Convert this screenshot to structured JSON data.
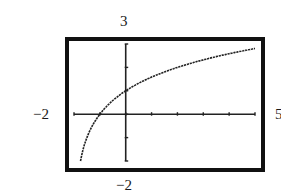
{
  "chart_data": {
    "type": "line",
    "title": "",
    "xlabel": "",
    "ylabel": "",
    "xlim": [
      -2,
      5
    ],
    "ylim": [
      -2,
      3
    ],
    "xscale": 1,
    "yscale": 1,
    "grid": false,
    "legend": null,
    "window_labels": {
      "xmin": "−2",
      "xmax": "5",
      "ymin": "−2",
      "ymax": "3"
    },
    "series": [
      {
        "name": "curve",
        "description": "logarithmic curve through (-1, 0) and (0, 1), vertical asymptote near x = -2",
        "x": [
          -1.8,
          -1.5,
          -1,
          -0.5,
          0,
          0.5,
          1,
          1.5,
          2,
          2.5,
          3,
          3.5,
          4,
          4.5,
          5
        ],
        "values": [
          -2.0,
          -1.0,
          0.0,
          0.58,
          1.0,
          1.32,
          1.58,
          1.81,
          2.0,
          2.17,
          2.32,
          2.46,
          2.58,
          2.7,
          2.81
        ]
      }
    ],
    "annotations": [
      {
        "text": "3",
        "position": "top"
      },
      {
        "text": "−2",
        "position": "left"
      },
      {
        "text": "5",
        "position": "right"
      },
      {
        "text": "−2",
        "position": "bottom"
      }
    ]
  },
  "labels": {
    "ymax": "3",
    "xmin": "−2",
    "xmax": "5",
    "ymin": "−2"
  },
  "colors": {
    "frame": "#111111",
    "axes": "#222222",
    "curve": "#222222",
    "background": "#ffffff"
  }
}
